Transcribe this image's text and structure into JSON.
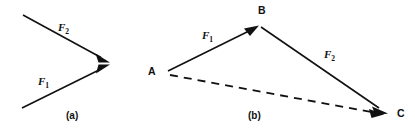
{
  "figure": {
    "width": 415,
    "height": 134,
    "background_color": "#ffffff",
    "ink_color": "#111111",
    "panels": [
      {
        "id": "a",
        "caption": "(a)",
        "caption_x": 66,
        "caption_y": 111,
        "description": "Two concurrent force vectors meeting head-to-head at a common point",
        "vectors": [
          {
            "name": "F2",
            "label": "F",
            "subscript": "2",
            "label_x": 58,
            "label_y": 22,
            "label_rotation": 0,
            "x1": 23,
            "y1": 15,
            "x2": 107,
            "y2": 61
          },
          {
            "name": "F1",
            "label": "F",
            "subscript": "1",
            "label_x": 38,
            "label_y": 76,
            "label_rotation": 0,
            "x1": 22,
            "y1": 108,
            "x2": 107,
            "y2": 66
          }
        ]
      },
      {
        "id": "b",
        "caption": "(b)",
        "caption_x": 248,
        "caption_y": 111,
        "description": "Triangle law of vector addition: F1 from A to B, F2 from B to C, resultant dashed from A to C",
        "points": [
          {
            "name": "A",
            "label": "A",
            "label_x": 148,
            "label_y": 66,
            "x": 166,
            "y": 72
          },
          {
            "name": "B",
            "label": "B",
            "label_x": 258,
            "label_y": 5,
            "x": 259,
            "y": 25
          },
          {
            "name": "C",
            "label": "C",
            "label_x": 397,
            "label_y": 108,
            "x": 387,
            "y": 113
          }
        ],
        "vectors": [
          {
            "name": "F1",
            "label": "F",
            "subscript": "1",
            "label_x": 202,
            "label_y": 30,
            "from": "A",
            "to": "B",
            "x1": 168,
            "y1": 71,
            "x2": 257,
            "y2": 27,
            "style": "solid"
          },
          {
            "name": "F2",
            "label": "F",
            "subscript": "2",
            "label_x": 324,
            "label_y": 49,
            "from": "B",
            "to": "C",
            "x1": 262,
            "y1": 27,
            "x2": 386,
            "y2": 112,
            "style": "solid"
          },
          {
            "name": "resultant",
            "label": "",
            "subscript": "",
            "from": "A",
            "to": "C",
            "x1": 170,
            "y1": 75,
            "x2": 384,
            "y2": 114,
            "style": "dashed"
          }
        ]
      }
    ]
  }
}
